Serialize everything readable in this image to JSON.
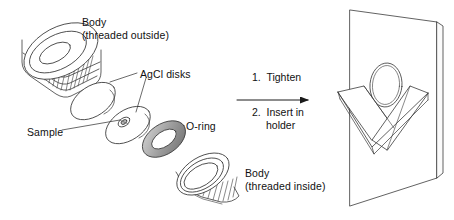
{
  "figure": {
    "type": "exploded-assembly-diagram",
    "background_color": "#ffffff",
    "line_color": "#3a3a3a",
    "text_color": "#111111"
  },
  "labels": {
    "body_outside": "Body\n(threaded outside)",
    "body_outside_line1": "Body",
    "body_outside_line2": "(threaded outside)",
    "agcl_disks": "AgCl disks",
    "sample": "Sample",
    "o_ring": "O-ring",
    "body_inside_line1": "Body",
    "body_inside_line2": "(threaded inside)"
  },
  "steps": [
    {
      "number": "1.",
      "text": "Tighten",
      "text_line2": ""
    },
    {
      "number": "2.",
      "text": "Insert in",
      "text_line2": "holder"
    }
  ],
  "components": [
    {
      "name": "body-threaded-outside",
      "shape": "knurled-cylinder",
      "label": "Body (threaded outside)"
    },
    {
      "name": "agcl-disk-upper",
      "shape": "ellipse-disk",
      "label": "AgCl disks"
    },
    {
      "name": "agcl-disk-lower",
      "shape": "ellipse-disk-with-sample",
      "label": "AgCl disks"
    },
    {
      "name": "sample-spot",
      "shape": "small-blob",
      "label": "Sample"
    },
    {
      "name": "o-ring",
      "shape": "torus",
      "label": "O-ring"
    },
    {
      "name": "body-threaded-inside",
      "shape": "knurled-ring",
      "label": "Body (threaded inside)"
    },
    {
      "name": "holder-plate",
      "shape": "rectangular-plate-with-aperture",
      "label": ""
    },
    {
      "name": "v-bracket",
      "shape": "v-shaped-clip",
      "label": ""
    }
  ],
  "arrow": {
    "direction": "right",
    "from_x": 237,
    "to_x": 312,
    "y": 100
  }
}
